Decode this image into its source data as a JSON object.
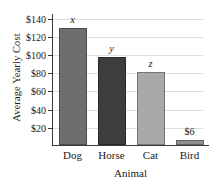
{
  "chart_data": {
    "type": "bar",
    "title": "",
    "xlabel": "Animal",
    "ylabel": "Average Yearly Cost",
    "categories": [
      "Dog",
      "Horse",
      "Cat",
      "Bird"
    ],
    "values": [
      129,
      97,
      81,
      6
    ],
    "point_labels": [
      "x",
      "y",
      "z",
      "$6"
    ],
    "bar_colors": [
      "#6e6e6e",
      "#3d3d3d",
      "#a8a8a8",
      "#8f8f8f"
    ],
    "ylim": [
      0,
      145
    ],
    "yticks": [
      20,
      40,
      60,
      80,
      100,
      120,
      140
    ],
    "ytick_labels": [
      "$20",
      "$40",
      "$60",
      "$80",
      "$100",
      "$120",
      "$140"
    ],
    "grid": true,
    "legend": false,
    "axis_color": "#3a3a3a",
    "gridline_color": "#dcdcdc",
    "background": "#ffffff"
  }
}
